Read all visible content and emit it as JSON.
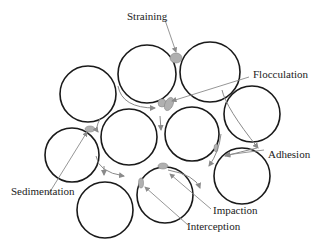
{
  "diagram": {
    "labels": {
      "straining": "Straining",
      "flocculation": "Flocculation",
      "adhesion": "Adhesion",
      "sedimentation": "Sedimentation",
      "impaction": "Impaction",
      "interception": "Interception"
    },
    "colors": {
      "grain_stroke": "#1a1a1a",
      "particle_fill": "#b0b0b0",
      "arrow": "#8a8a8a"
    },
    "grains": [
      {
        "cx": 88,
        "cy": 94,
        "r": 28
      },
      {
        "cx": 147,
        "cy": 74,
        "r": 29
      },
      {
        "cx": 210,
        "cy": 72,
        "r": 30
      },
      {
        "cx": 252,
        "cy": 114,
        "r": 28
      },
      {
        "cx": 129,
        "cy": 137,
        "r": 28
      },
      {
        "cx": 192,
        "cy": 134,
        "r": 27
      },
      {
        "cx": 72,
        "cy": 155,
        "r": 27
      },
      {
        "cx": 105,
        "cy": 210,
        "r": 28
      },
      {
        "cx": 165,
        "cy": 195,
        "r": 28
      },
      {
        "cx": 242,
        "cy": 176,
        "r": 28
      }
    ]
  }
}
